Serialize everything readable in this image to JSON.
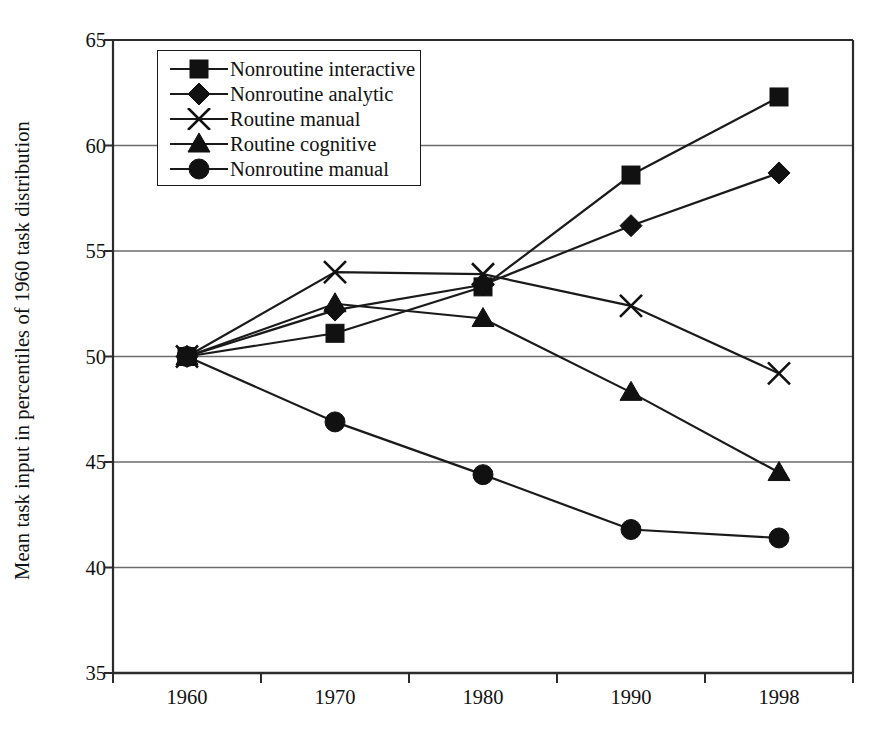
{
  "chart_data": {
    "type": "line",
    "title": "",
    "xlabel": "",
    "ylabel": "Mean task input in percentiles of 1960 task distribution",
    "categories": [
      "1960",
      "1970",
      "1980",
      "1990",
      "1998"
    ],
    "x": [
      1960,
      1970,
      1980,
      1990,
      1998
    ],
    "ylim": [
      35,
      65
    ],
    "yticks": [
      35,
      40,
      45,
      50,
      55,
      60,
      65
    ],
    "grid": true,
    "legend_position": "top-left",
    "series": [
      {
        "name": "Nonroutine interactive",
        "marker": "square",
        "values": [
          50.0,
          51.1,
          53.3,
          58.6,
          62.3
        ]
      },
      {
        "name": "Nonroutine analytic",
        "marker": "diamond",
        "values": [
          50.0,
          52.2,
          53.4,
          56.2,
          58.7
        ]
      },
      {
        "name": "Routine manual",
        "marker": "cross",
        "values": [
          50.0,
          54.0,
          53.9,
          52.4,
          49.2
        ]
      },
      {
        "name": "Routine cognitive",
        "marker": "triangle",
        "values": [
          50.0,
          52.5,
          51.8,
          48.3,
          44.5
        ]
      },
      {
        "name": "Nonroutine manual",
        "marker": "circle",
        "values": [
          50.0,
          46.9,
          44.4,
          41.8,
          41.4
        ]
      }
    ],
    "colors": {
      "line": "#1a1a1a",
      "marker": "#111111",
      "grid": "#6b6b6b",
      "frame": "#2b2b2b",
      "background": "#ffffff"
    }
  },
  "axes": {
    "y_tick_labels": [
      "65",
      "60",
      "55",
      "50",
      "45",
      "40",
      "35"
    ],
    "x_tick_labels": [
      "1960",
      "1970",
      "1980",
      "1990",
      "1998"
    ],
    "y_axis_title": "Mean task input in percentiles of 1960 task distribution"
  },
  "legend": {
    "entries": [
      {
        "label": "Nonroutine interactive",
        "marker": "square"
      },
      {
        "label": "Nonroutine analytic",
        "marker": "diamond"
      },
      {
        "label": "Routine manual",
        "marker": "cross"
      },
      {
        "label": "Routine cognitive",
        "marker": "triangle"
      },
      {
        "label": "Nonroutine manual",
        "marker": "circle"
      }
    ]
  }
}
